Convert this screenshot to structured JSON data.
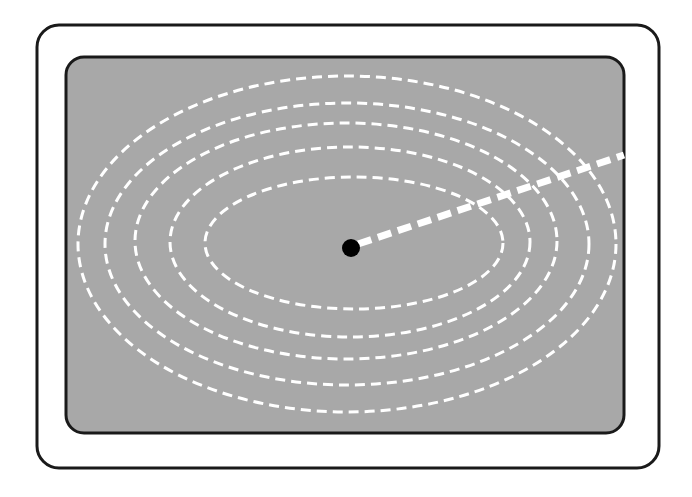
{
  "diagram": {
    "type": "concentric-contour-ellipses",
    "colors": {
      "background": "#ffffff",
      "frame_stroke": "#1a1a1a",
      "panel_fill": "#a8a8a8",
      "contour": "#ffffff",
      "ray": "#ffffff",
      "center_dot": "#000000"
    },
    "outer_frame": {
      "x": 37,
      "y": 25,
      "width": 622,
      "height": 443,
      "radius": 22
    },
    "inner_panel": {
      "x": 66,
      "y": 57,
      "width": 558,
      "height": 376,
      "radius": 18
    },
    "contours": [
      {
        "cx": 354,
        "cy": 243,
        "rx": 149,
        "ry": 66
      },
      {
        "cx": 350,
        "cy": 242,
        "rx": 180,
        "ry": 95
      },
      {
        "cx": 346,
        "cy": 241,
        "rx": 211,
        "ry": 118
      },
      {
        "cx": 347,
        "cy": 244,
        "rx": 242,
        "ry": 141
      },
      {
        "cx": 347,
        "cy": 244,
        "rx": 269,
        "ry": 168
      }
    ],
    "center_point": {
      "cx": 351,
      "cy": 248,
      "r": 9
    },
    "ray": {
      "x1": 358,
      "y1": 244,
      "x2": 624,
      "y2": 155
    }
  }
}
